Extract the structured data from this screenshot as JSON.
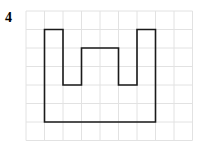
{
  "problem": {
    "number": "4"
  },
  "grid": {
    "columns": 9,
    "rows": 7,
    "origin_x": 26,
    "origin_y": 11,
    "cell_size": 18.5,
    "line_color": "#e2e2e2"
  },
  "shape": {
    "stroke_color": "#1a1a1a",
    "points": [
      [
        1,
        1
      ],
      [
        2,
        1
      ],
      [
        2,
        4
      ],
      [
        3,
        4
      ],
      [
        3,
        2
      ],
      [
        5,
        2
      ],
      [
        5,
        4
      ],
      [
        6,
        4
      ],
      [
        6,
        1
      ],
      [
        7,
        1
      ],
      [
        7,
        6
      ],
      [
        1,
        6
      ]
    ]
  }
}
